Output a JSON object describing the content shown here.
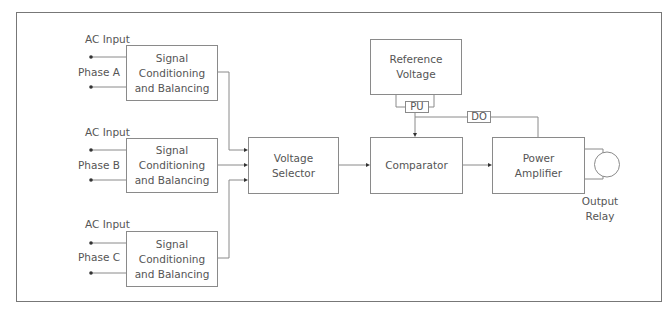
{
  "diagram": {
    "inputs": [
      {
        "header": "AC Input",
        "phase": "Phase A",
        "block": [
          "Signal",
          "Conditioning",
          "and Balancing"
        ]
      },
      {
        "header": "AC Input",
        "phase": "Phase B",
        "block": [
          "Signal",
          "Conditioning",
          "and Balancing"
        ]
      },
      {
        "header": "AC Input",
        "phase": "Phase C",
        "block": [
          "Signal",
          "Conditioning",
          "and Balancing"
        ]
      }
    ],
    "voltage_selector": [
      "Voltage",
      "Selector"
    ],
    "reference_voltage": [
      "Reference",
      "Voltage"
    ],
    "pu_label": "PU",
    "do_label": "DO",
    "comparator": "Comparator",
    "power_amplifier": [
      "Power",
      "Amplifier"
    ],
    "output_relay": [
      "Output",
      "Relay"
    ],
    "colors": {
      "line": "#8a8a8a",
      "text": "#555555",
      "frame": "#777777"
    }
  }
}
